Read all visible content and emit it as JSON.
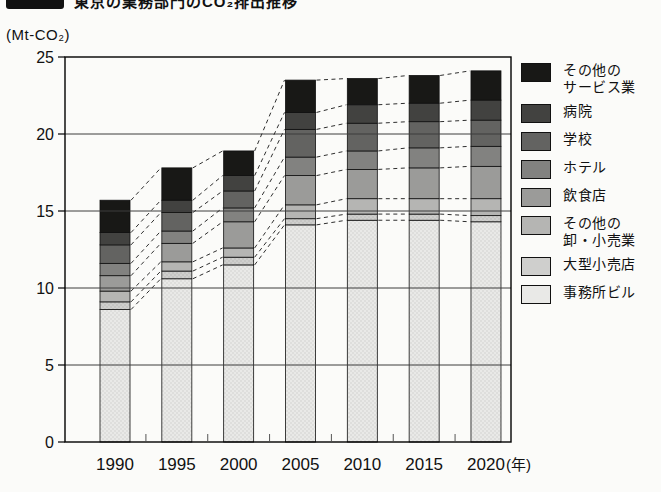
{
  "header": {
    "title": "東京の業務部門のCO₂排出推移"
  },
  "chart_data": {
    "type": "bar",
    "stacked": true,
    "title": "東京の業務部門のCO₂排出推移",
    "unit_label": "(Mt-CO₂)",
    "xlabel": "",
    "ylabel": "Mt-CO₂",
    "x_suffix": "(年)",
    "categories": [
      "1990",
      "1995",
      "2000",
      "2005",
      "2010",
      "2015",
      "2020"
    ],
    "yticks": [
      "0",
      "5",
      "10",
      "15",
      "20",
      "25"
    ],
    "ylim": [
      0,
      25
    ],
    "grid": true,
    "legend_position": "right",
    "connector_style": "dashed",
    "series": [
      {
        "name": "事務所ビル",
        "color": "#e9e9e7",
        "dot": "#d0d0ce",
        "values": [
          8.6,
          10.6,
          11.5,
          14.1,
          14.4,
          14.4,
          14.3
        ]
      },
      {
        "name": "大型小売店",
        "color": "#cfcfcd",
        "dot": "#b9b9b7",
        "values": [
          0.5,
          0.5,
          0.5,
          0.4,
          0.4,
          0.4,
          0.4
        ]
      },
      {
        "name": "その他の卸・小売業",
        "color": "#b5b5b3",
        "values": [
          0.7,
          0.6,
          0.6,
          0.9,
          1.0,
          1.0,
          1.1
        ]
      },
      {
        "name": "飲食店",
        "color": "#9b9b99",
        "values": [
          1.0,
          1.2,
          1.7,
          1.9,
          1.9,
          2.0,
          2.1
        ]
      },
      {
        "name": "ホテル",
        "color": "#828280",
        "values": [
          0.8,
          0.8,
          0.9,
          1.2,
          1.2,
          1.3,
          1.3
        ]
      },
      {
        "name": "学校",
        "color": "#636361",
        "values": [
          1.2,
          1.2,
          1.1,
          1.8,
          1.8,
          1.7,
          1.7
        ]
      },
      {
        "name": "病院",
        "color": "#424240",
        "values": [
          0.8,
          0.8,
          1.0,
          1.1,
          1.2,
          1.2,
          1.3
        ]
      },
      {
        "name": "その他のサービス業",
        "color": "#181816",
        "values": [
          2.1,
          2.1,
          1.6,
          2.1,
          1.7,
          1.8,
          1.9
        ]
      }
    ],
    "totals": [
      15.7,
      17.8,
      18.9,
      23.5,
      23.6,
      23.8,
      24.1
    ]
  },
  "legend": {
    "items": [
      {
        "label": "その他の\nサービス業",
        "series_index": 7
      },
      {
        "label": "病院",
        "series_index": 6
      },
      {
        "label": "学校",
        "series_index": 5
      },
      {
        "label": "ホテル",
        "series_index": 4
      },
      {
        "label": "飲食店",
        "series_index": 3
      },
      {
        "label": "その他の\n卸・小売業",
        "series_index": 2
      },
      {
        "label": "大型小売店",
        "series_index": 1
      },
      {
        "label": "事務所ビル",
        "series_index": 0
      }
    ]
  }
}
